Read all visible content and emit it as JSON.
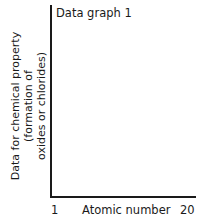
{
  "chart_data": {
    "type": "line",
    "title": "Data graph 1",
    "xlabel": "Atomic number",
    "ylabel": "Data for chemical property (formation of oxides or chlorides)",
    "ylabel_lines": [
      "Data for chemical property",
      "(formation of",
      "oxides or chlorides)"
    ],
    "x_ticks": [
      "1",
      "20"
    ],
    "xlim": [
      1,
      20
    ],
    "series": [],
    "grid": false,
    "legend": null
  }
}
